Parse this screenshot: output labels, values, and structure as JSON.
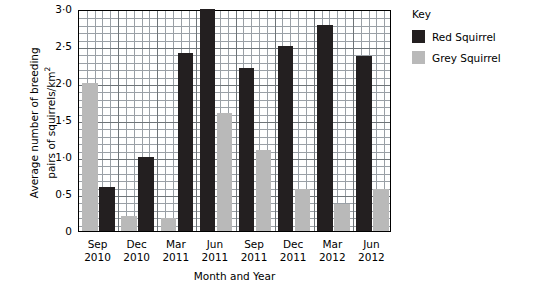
{
  "chart_data": {
    "type": "bar",
    "title": "",
    "xlabel": "Month and Year",
    "ylabel": "Average number of breeding pairs of squirrels/km2",
    "categories": [
      "Sep 2010",
      "Dec 2010",
      "Mar 2011",
      "Jun 2011",
      "Sep 2011",
      "Dec 2011",
      "Mar 2012",
      "Jun 2012"
    ],
    "category_lines": [
      [
        "Sep",
        "2010"
      ],
      [
        "Dec",
        "2010"
      ],
      [
        "Mar",
        "2011"
      ],
      [
        "Jun",
        "2011"
      ],
      [
        "Sep",
        "2011"
      ],
      [
        "Dec",
        "2011"
      ],
      [
        "Mar",
        "2012"
      ],
      [
        "Jun",
        "2012"
      ]
    ],
    "series": [
      {
        "name": "Red Squirrel",
        "color": "#231f20",
        "values": [
          0.6,
          1.0,
          2.4,
          3.0,
          2.2,
          2.5,
          2.78,
          2.37
        ]
      },
      {
        "name": "Grey Squirrel",
        "color": "#b9b9b9",
        "values": [
          2.0,
          0.2,
          0.18,
          1.6,
          1.1,
          0.57,
          0.37,
          0.57
        ]
      }
    ],
    "ylim": [
      0,
      3.0
    ],
    "ytick_labels": [
      "0",
      "0·5",
      "1·0",
      "1·5",
      "2·0",
      "2·5",
      "3·0"
    ],
    "ytick_values": [
      0,
      0.5,
      1.0,
      1.5,
      2.0,
      2.5,
      3.0
    ],
    "grid": true,
    "minor_grid_divisions": 5,
    "legend_position": "right"
  },
  "legend": {
    "title": "Key",
    "entries": [
      {
        "label": "Red Squirrel",
        "color": "#231f20"
      },
      {
        "label": "Grey Squirrel",
        "color": "#b9b9b9"
      }
    ]
  },
  "axis": {
    "y_title_line1": "Average number of breeding",
    "y_title_line2": "pairs of squirrels/km",
    "y_title_sup": "2",
    "x_title": "Month and Year"
  }
}
